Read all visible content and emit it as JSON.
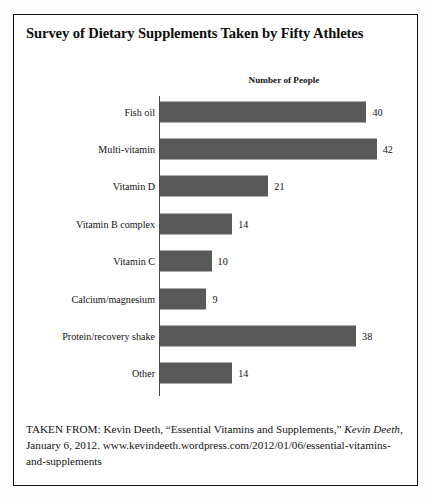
{
  "title": "Survey of Dietary Supplements Taken by Fifty Athletes",
  "colors": {
    "bar_fill": "#595959",
    "border": "#111111",
    "text": "#101010",
    "background": "#ffffff"
  },
  "chart_data": {
    "type": "bar",
    "orientation": "horizontal",
    "title": "Survey of Dietary Supplements Taken by Fifty Athletes",
    "xlabel": "Number of People",
    "ylabel": "",
    "subtitle": "Number of People",
    "grid": false,
    "legend": null,
    "xlim": [
      0,
      45
    ],
    "categories": [
      "Fish oil",
      "Multi-vitamin",
      "Vitamin D",
      "Vitamin B complex",
      "Vitamin C",
      "Calcium/magnesium",
      "Protein/recovery shake",
      "Other"
    ],
    "values": [
      40,
      42,
      21,
      14,
      10,
      9,
      38,
      14
    ],
    "data_labels": [
      "40",
      "42",
      "21",
      "14",
      "10",
      "9",
      "38",
      "14"
    ],
    "bar_color": "#595959"
  },
  "caption": {
    "part1": "TAKEN FROM: Kevin Deeth, “Essential Vitamins and Supplements,” ",
    "italic": "Kevin Deeth",
    "part2": ", January 6, 2012. www.kevindeeth.wordpress.com/2012/01/06/essential-vitamins-and-supplements"
  }
}
